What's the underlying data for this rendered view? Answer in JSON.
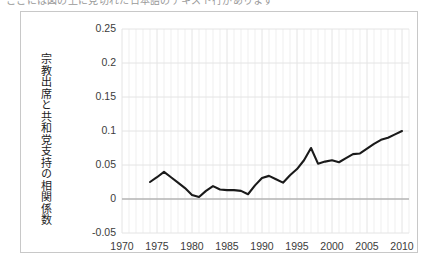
{
  "page": {
    "clipped_top_text": "ここには図の上に見切れた日本語のテキスト行があります",
    "background_color": "#ffffff",
    "border_color": "#c8c8c8"
  },
  "chart_data": {
    "type": "line",
    "title": "",
    "xlabel": "",
    "ylabel": "宗教出席と共和党支持の相関係数",
    "xlim": [
      1970,
      2011
    ],
    "ylim": [
      -0.05,
      0.25
    ],
    "grid": true,
    "legend": "none",
    "line_color": "#1a1a1a",
    "grid_color": "#e4e4e4",
    "axis_color": "#9b9b9b",
    "ytick_labels": [
      "0.25",
      "0.2",
      "0.15",
      "0.1",
      "0.05",
      "0",
      "-0.05"
    ],
    "ytick_values": [
      0.25,
      0.2,
      0.15,
      0.1,
      0.05,
      0,
      -0.05
    ],
    "xtick_labels": [
      "1970",
      "1975",
      "1980",
      "1985",
      "1990",
      "1995",
      "2000",
      "2005",
      "2010"
    ],
    "xtick_values": [
      1970,
      1975,
      1980,
      1985,
      1990,
      1995,
      2000,
      2005,
      2010
    ],
    "x": [
      1974,
      1975,
      1976,
      1977,
      1978,
      1979,
      1980,
      1981,
      1982,
      1983,
      1984,
      1985,
      1986,
      1987,
      1988,
      1989,
      1990,
      1991,
      1992,
      1993,
      1994,
      1995,
      1996,
      1997,
      1998,
      1999,
      2000,
      2001,
      2002,
      2003,
      2004,
      2005,
      2006,
      2007,
      2008,
      2009,
      2010
    ],
    "values": [
      0.025,
      0.032,
      0.04,
      0.032,
      0.024,
      0.016,
      0.006,
      0.003,
      0.012,
      0.019,
      0.014,
      0.013,
      0.013,
      0.012,
      0.007,
      0.02,
      0.031,
      0.034,
      0.029,
      0.024,
      0.035,
      0.044,
      0.057,
      0.075,
      0.052,
      0.055,
      0.057,
      0.054,
      0.06,
      0.066,
      0.067,
      0.074,
      0.081,
      0.087,
      0.09,
      0.095,
      0.1
    ],
    "series_name": "宗教出席と共和党支持の相関係数"
  }
}
